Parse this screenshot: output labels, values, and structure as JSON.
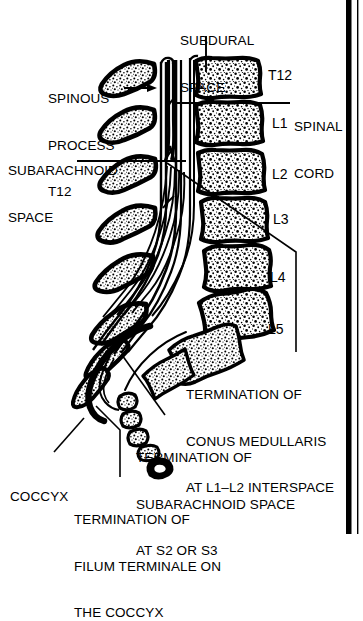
{
  "figure": {
    "type": "anatomical-diagram",
    "background_color": "#ffffff",
    "ink_color": "#000000"
  },
  "border": {
    "right_thick_bar": true,
    "right_thin_rule": true
  },
  "labels": {
    "subdural_space": {
      "lines": [
        "SUBDURAL",
        "SPACE"
      ],
      "x": 180,
      "y": 2
    },
    "spinous_process": {
      "lines": [
        "SPINOUS",
        "PROCESS",
        "T12"
      ],
      "x": 48,
      "y": 60
    },
    "subarachnoid_space": {
      "lines": [
        "SUBARACHNOID",
        "SPACE"
      ],
      "x": 8,
      "y": 132
    },
    "spinal_cord": {
      "lines": [
        "SPINAL",
        "CORD"
      ],
      "x": 294,
      "y": 88
    },
    "termination_conus": {
      "lines": [
        "TERMINATION OF",
        "CONUS MEDULLARIS",
        "AT L1–L2 INTERSPACE"
      ],
      "x": 186,
      "y": 356
    },
    "termination_subarachnoid": {
      "lines": [
        "TERMINATION OF",
        "SUBARACHNOID SPACE",
        "AT S2 OR S3"
      ],
      "x": 136,
      "y": 419
    },
    "coccyx": {
      "lines": [
        "COCCYX"
      ],
      "x": 10,
      "y": 458
    },
    "termination_filum": {
      "lines": [
        "TERMINATION OF",
        "FILUM TERMINALE ON",
        "THE COCCYX"
      ],
      "x": 74,
      "y": 481
    }
  },
  "vertebra_levels": [
    {
      "label": "T12",
      "x": 268,
      "y": 68
    },
    {
      "label": "L1",
      "x": 272,
      "y": 116
    },
    {
      "label": "L2",
      "x": 272,
      "y": 167
    },
    {
      "label": "L3",
      "x": 273,
      "y": 212
    },
    {
      "label": "L4",
      "x": 270,
      "y": 270
    },
    {
      "label": "L5",
      "x": 268,
      "y": 322
    }
  ],
  "chart_data": {
    "type": "table",
    "categories": [
      "T12",
      "L1",
      "L2",
      "L3",
      "L4",
      "L5"
    ],
    "annotations": [
      "SUBDURAL SPACE",
      "SPINOUS PROCESS T12",
      "SUBARACHNOID SPACE",
      "SPINAL CORD",
      "TERMINATION OF CONUS MEDULLARIS AT L1–L2 INTERSPACE",
      "TERMINATION OF SUBARACHNOID SPACE AT S2 OR S3",
      "TERMINATION OF FILUM TERMINALE ON THE COCCYX",
      "COCCYX"
    ]
  }
}
